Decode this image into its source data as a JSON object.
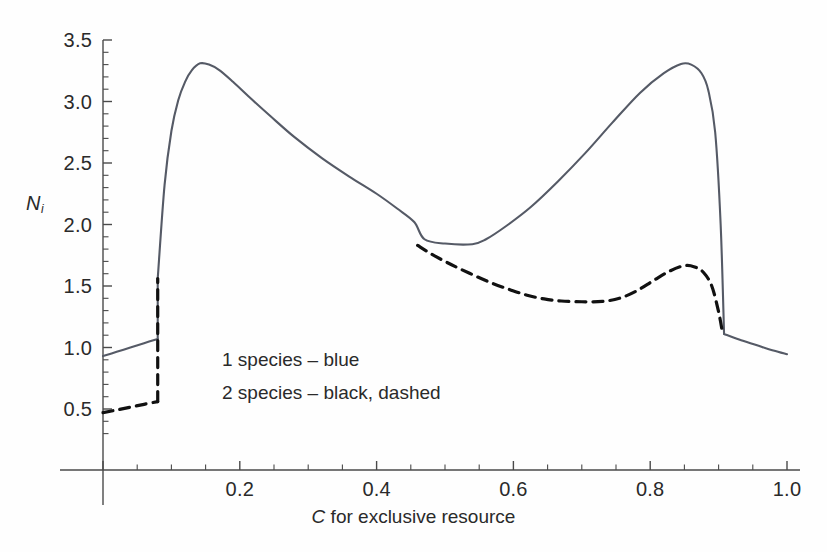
{
  "figure": {
    "background": "#fefefe",
    "axis_color": "#4a4a4a",
    "text_color": "#2a2a2a"
  },
  "axes": {
    "ylabel_main": "N",
    "ylabel_sub": "i",
    "xlabel_italic": "C",
    "xlabel_rest": " for exclusive resource",
    "yticks": [
      "3.5",
      "3.0",
      "2.5",
      "2.0",
      "1.5",
      "1.0",
      "0.5"
    ],
    "ytick_values": [
      3.5,
      3.0,
      2.5,
      2.0,
      1.5,
      1.0,
      0.5
    ],
    "xticks": [
      "0.2",
      "0.4",
      "0.6",
      "0.8",
      "1.0"
    ],
    "xtick_values": [
      0.2,
      0.4,
      0.6,
      0.8,
      1.0
    ]
  },
  "legend": {
    "entries": [
      {
        "label": "1 species – blue",
        "style": "solid",
        "color": "#555a66"
      },
      {
        "label": "2 species – black, dashed",
        "style": "dashed",
        "color": "#111111"
      }
    ]
  },
  "chart_data": {
    "type": "line",
    "title": "",
    "xlabel": "C for exclusive resource",
    "ylabel": "N_i",
    "xlim": [
      0.0,
      1.0
    ],
    "ylim": [
      0.25,
      3.5
    ],
    "grid": false,
    "legend_position": "inside-left",
    "annotations": [
      "Vertical discontinuity (transcritical jump) at C ≈ 0.08",
      "Solid curve plateau at N_i ≈ 1.83 between C ≈ 0.46 and C ≈ 0.54",
      "Vertical drop back at C ≈ 0.91"
    ],
    "series": [
      {
        "name": "1 species – blue",
        "style": "solid",
        "color": "#555a66",
        "width": 2.1,
        "segments": [
          {
            "comment": "low branch before jump",
            "x": [
              0.0,
              0.02,
              0.04,
              0.06,
              0.08
            ],
            "y": [
              0.93,
              0.965,
              1.0,
              1.035,
              1.07
            ]
          },
          {
            "comment": "vertical jump at C = 0.08",
            "x": [
              0.08,
              0.08
            ],
            "y": [
              1.07,
              1.56
            ]
          },
          {
            "comment": "main upper branch: rise, peak 3.31, decline to plateau, rise to peak 3.31, steep fall",
            "x": [
              0.08,
              0.09,
              0.1,
              0.11,
              0.12,
              0.13,
              0.142,
              0.155,
              0.17,
              0.19,
              0.215,
              0.245,
              0.28,
              0.32,
              0.36,
              0.4,
              0.43,
              0.455,
              0.47,
              0.5,
              0.54,
              0.56,
              0.59,
              0.625,
              0.665,
              0.705,
              0.745,
              0.785,
              0.82,
              0.845,
              0.86,
              0.875,
              0.885,
              0.895,
              0.903,
              0.908
            ],
            "y": [
              1.56,
              2.32,
              2.76,
              3.01,
              3.16,
              3.255,
              3.31,
              3.3,
              3.255,
              3.16,
              3.03,
              2.88,
              2.71,
              2.54,
              2.39,
              2.25,
              2.13,
              2.02,
              1.88,
              1.845,
              1.84,
              1.88,
              1.99,
              2.14,
              2.35,
              2.58,
              2.83,
              3.07,
              3.23,
              3.305,
              3.3,
              3.23,
              3.09,
              2.75,
              2.0,
              1.11
            ]
          },
          {
            "comment": "low branch after drop",
            "x": [
              0.908,
              0.93,
              0.955,
              0.98,
              1.0
            ],
            "y": [
              1.11,
              1.065,
              1.02,
              0.975,
              0.945
            ]
          }
        ]
      },
      {
        "name": "2 species – black, dashed",
        "style": "dashed",
        "color": "#111111",
        "width": 3.2,
        "segments": [
          {
            "comment": "low branch before jump",
            "x": [
              0.0,
              0.02,
              0.04,
              0.06,
              0.08
            ],
            "y": [
              0.47,
              0.492,
              0.515,
              0.538,
              0.56
            ]
          },
          {
            "comment": "vertical jump at C = 0.08 (overlaid by solid until branch separates)",
            "x": [
              0.08,
              0.08
            ],
            "y": [
              0.56,
              1.56
            ]
          },
          {
            "comment": "coexistence branch emerges at plateau C = 0.46, declines to min 1.37, rises to 1.67",
            "x": [
              0.46,
              0.48,
              0.5,
              0.52,
              0.545,
              0.57,
              0.595,
              0.62,
              0.645,
              0.67,
              0.7,
              0.73,
              0.755,
              0.78,
              0.805,
              0.828,
              0.85,
              0.865,
              0.878,
              0.89,
              0.9,
              0.906
            ],
            "y": [
              1.83,
              1.76,
              1.7,
              1.645,
              1.58,
              1.52,
              1.47,
              1.425,
              1.395,
              1.378,
              1.372,
              1.375,
              1.4,
              1.46,
              1.545,
              1.62,
              1.665,
              1.655,
              1.61,
              1.5,
              1.29,
              1.11
            ]
          }
        ]
      }
    ]
  }
}
